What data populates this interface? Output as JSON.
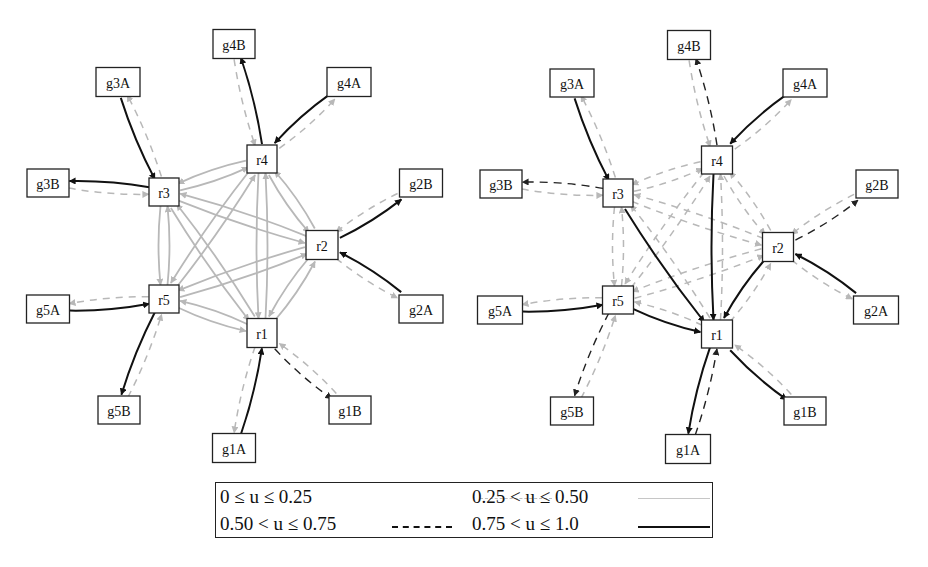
{
  "figure": {
    "title": "",
    "graphs": [
      {
        "id": "left",
        "nodes": [
          {
            "id": "g4B",
            "label": "g4B",
            "x": 234,
            "y": 44,
            "w": 42,
            "h": 29
          },
          {
            "id": "g3A",
            "label": "g3A",
            "x": 118,
            "y": 82,
            "w": 44,
            "h": 29
          },
          {
            "id": "g4A",
            "label": "g4A",
            "x": 349,
            "y": 82,
            "w": 44,
            "h": 29
          },
          {
            "id": "r4",
            "label": "r4",
            "x": 262,
            "y": 159,
            "w": 30,
            "h": 28
          },
          {
            "id": "g3B",
            "label": "g3B",
            "x": 48,
            "y": 183,
            "w": 42,
            "h": 28
          },
          {
            "id": "r3",
            "label": "r3",
            "x": 164,
            "y": 192,
            "w": 30,
            "h": 28
          },
          {
            "id": "g2B",
            "label": "g2B",
            "x": 421,
            "y": 183,
            "w": 43,
            "h": 28
          },
          {
            "id": "r2",
            "label": "r2",
            "x": 322,
            "y": 245,
            "w": 32,
            "h": 29
          },
          {
            "id": "r5",
            "label": "r5",
            "x": 164,
            "y": 299,
            "w": 30,
            "h": 28
          },
          {
            "id": "g5A",
            "label": "g5A",
            "x": 48,
            "y": 309,
            "w": 43,
            "h": 28
          },
          {
            "id": "g2A",
            "label": "g2A",
            "x": 421,
            "y": 309,
            "w": 44,
            "h": 28
          },
          {
            "id": "r1",
            "label": "r1",
            "x": 262,
            "y": 333,
            "w": 30,
            "h": 29
          },
          {
            "id": "g5B",
            "label": "g5B",
            "x": 119,
            "y": 410,
            "w": 42,
            "h": 28
          },
          {
            "id": "g1B",
            "label": "g1B",
            "x": 350,
            "y": 410,
            "w": 42,
            "h": 28
          },
          {
            "id": "g1A",
            "label": "g1A",
            "x": 234,
            "y": 448,
            "w": 43,
            "h": 29
          }
        ],
        "edges": [
          {
            "from": "g3A",
            "to": "r3",
            "u": "0.75-1.0"
          },
          {
            "from": "r3",
            "to": "g3A",
            "u": "0-0.25"
          },
          {
            "from": "r4",
            "to": "g4B",
            "u": "0.75-1.0"
          },
          {
            "from": "g4B",
            "to": "r4",
            "u": "0-0.25"
          },
          {
            "from": "g4A",
            "to": "r4",
            "u": "0.75-1.0"
          },
          {
            "from": "r4",
            "to": "g4A",
            "u": "0-0.25"
          },
          {
            "from": "r3",
            "to": "g3B",
            "u": "0.75-1.0"
          },
          {
            "from": "g3B",
            "to": "r3",
            "u": "0-0.25"
          },
          {
            "from": "r2",
            "to": "g2B",
            "u": "0.75-1.0"
          },
          {
            "from": "g2B",
            "to": "r2",
            "u": "0-0.25"
          },
          {
            "from": "g2A",
            "to": "r2",
            "u": "0.75-1.0"
          },
          {
            "from": "r2",
            "to": "g2A",
            "u": "0-0.25"
          },
          {
            "from": "g5A",
            "to": "r5",
            "u": "0.75-1.0"
          },
          {
            "from": "r5",
            "to": "g5A",
            "u": "0-0.25"
          },
          {
            "from": "r5",
            "to": "g5B",
            "u": "0.75-1.0"
          },
          {
            "from": "g5B",
            "to": "r5",
            "u": "0-0.25"
          },
          {
            "from": "g1A",
            "to": "r1",
            "u": "0.75-1.0"
          },
          {
            "from": "r1",
            "to": "g1A",
            "u": "0-0.25"
          },
          {
            "from": "r1",
            "to": "g1B",
            "u": "0.50-0.75"
          },
          {
            "from": "g1B",
            "to": "r1",
            "u": "0-0.25"
          },
          {
            "from": "r3",
            "to": "r4",
            "u": "0.25-0.50"
          },
          {
            "from": "r4",
            "to": "r3",
            "u": "0.25-0.50"
          },
          {
            "from": "r3",
            "to": "r2",
            "u": "0.25-0.50"
          },
          {
            "from": "r2",
            "to": "r3",
            "u": "0.25-0.50"
          },
          {
            "from": "r3",
            "to": "r5",
            "u": "0.25-0.50"
          },
          {
            "from": "r5",
            "to": "r3",
            "u": "0.25-0.50"
          },
          {
            "from": "r3",
            "to": "r1",
            "u": "0.25-0.50"
          },
          {
            "from": "r1",
            "to": "r3",
            "u": "0.25-0.50"
          },
          {
            "from": "r4",
            "to": "r2",
            "u": "0.25-0.50"
          },
          {
            "from": "r2",
            "to": "r4",
            "u": "0.25-0.50"
          },
          {
            "from": "r4",
            "to": "r5",
            "u": "0.25-0.50"
          },
          {
            "from": "r5",
            "to": "r4",
            "u": "0.25-0.50"
          },
          {
            "from": "r4",
            "to": "r1",
            "u": "0.25-0.50"
          },
          {
            "from": "r1",
            "to": "r4",
            "u": "0.25-0.50"
          },
          {
            "from": "r2",
            "to": "r5",
            "u": "0.25-0.50"
          },
          {
            "from": "r5",
            "to": "r2",
            "u": "0.25-0.50"
          },
          {
            "from": "r2",
            "to": "r1",
            "u": "0.25-0.50"
          },
          {
            "from": "r1",
            "to": "r2",
            "u": "0.25-0.50"
          },
          {
            "from": "r5",
            "to": "r1",
            "u": "0.25-0.50"
          },
          {
            "from": "r1",
            "to": "r5",
            "u": "0.25-0.50"
          }
        ]
      },
      {
        "id": "right",
        "nodes": [
          {
            "id": "g4B",
            "label": "g4B",
            "x": 689,
            "y": 45,
            "w": 43,
            "h": 29
          },
          {
            "id": "g3A",
            "label": "g3A",
            "x": 572,
            "y": 83,
            "w": 44,
            "h": 28
          },
          {
            "id": "g4A",
            "label": "g4A",
            "x": 805,
            "y": 83,
            "w": 44,
            "h": 28
          },
          {
            "id": "r4",
            "label": "r4",
            "x": 717,
            "y": 160,
            "w": 31,
            "h": 28
          },
          {
            "id": "g3B",
            "label": "g3B",
            "x": 501,
            "y": 184,
            "w": 42,
            "h": 28
          },
          {
            "id": "r3",
            "label": "r3",
            "x": 618,
            "y": 193,
            "w": 30,
            "h": 28
          },
          {
            "id": "g2B",
            "label": "g2B",
            "x": 877,
            "y": 184,
            "w": 42,
            "h": 28
          },
          {
            "id": "r2",
            "label": "r2",
            "x": 778,
            "y": 247,
            "w": 31,
            "h": 29
          },
          {
            "id": "r5",
            "label": "r5",
            "x": 618,
            "y": 300,
            "w": 31,
            "h": 28
          },
          {
            "id": "g5A",
            "label": "g5A",
            "x": 500,
            "y": 310,
            "w": 45,
            "h": 28
          },
          {
            "id": "g2A",
            "label": "g2A",
            "x": 876,
            "y": 310,
            "w": 45,
            "h": 28
          },
          {
            "id": "r1",
            "label": "r1",
            "x": 717,
            "y": 334,
            "w": 31,
            "h": 28
          },
          {
            "id": "g5B",
            "label": "g5B",
            "x": 572,
            "y": 411,
            "w": 43,
            "h": 28
          },
          {
            "id": "g1B",
            "label": "g1B",
            "x": 805,
            "y": 411,
            "w": 42,
            "h": 28
          },
          {
            "id": "g1A",
            "label": "g1A",
            "x": 688,
            "y": 449,
            "w": 45,
            "h": 29
          }
        ],
        "edges": [
          {
            "from": "g3A",
            "to": "r3",
            "u": "0.75-1.0"
          },
          {
            "from": "r3",
            "to": "g3A",
            "u": "0-0.25"
          },
          {
            "from": "r4",
            "to": "g4B",
            "u": "0.50-0.75"
          },
          {
            "from": "g4B",
            "to": "r4",
            "u": "0-0.25"
          },
          {
            "from": "g4A",
            "to": "r4",
            "u": "0.75-1.0"
          },
          {
            "from": "r4",
            "to": "g4A",
            "u": "0-0.25"
          },
          {
            "from": "r3",
            "to": "g3B",
            "u": "0.50-0.75"
          },
          {
            "from": "g3B",
            "to": "r3",
            "u": "0-0.25"
          },
          {
            "from": "r2",
            "to": "g2B",
            "u": "0.50-0.75"
          },
          {
            "from": "g2B",
            "to": "r2",
            "u": "0-0.25"
          },
          {
            "from": "g2A",
            "to": "r2",
            "u": "0.75-1.0"
          },
          {
            "from": "r2",
            "to": "g2A",
            "u": "0-0.25"
          },
          {
            "from": "g5A",
            "to": "r5",
            "u": "0.75-1.0"
          },
          {
            "from": "r5",
            "to": "g5A",
            "u": "0-0.25"
          },
          {
            "from": "r5",
            "to": "g5B",
            "u": "0.50-0.75"
          },
          {
            "from": "g5B",
            "to": "r5",
            "u": "0-0.25"
          },
          {
            "from": "r1",
            "to": "g1A",
            "u": "0.75-1.0"
          },
          {
            "from": "g1A",
            "to": "r1",
            "u": "0.50-0.75"
          },
          {
            "from": "r1",
            "to": "g1B",
            "u": "0.75-1.0"
          },
          {
            "from": "g1B",
            "to": "r1",
            "u": "0-0.25"
          },
          {
            "from": "r3",
            "to": "r1",
            "u": "0.75-1.0"
          },
          {
            "from": "r4",
            "to": "r1",
            "u": "0.75-1.0"
          },
          {
            "from": "r2",
            "to": "r1",
            "u": "0.75-1.0"
          },
          {
            "from": "r5",
            "to": "r1",
            "u": "0.75-1.0"
          },
          {
            "from": "r3",
            "to": "r4",
            "u": "0-0.25"
          },
          {
            "from": "r4",
            "to": "r3",
            "u": "0-0.25"
          },
          {
            "from": "r3",
            "to": "r2",
            "u": "0-0.25"
          },
          {
            "from": "r2",
            "to": "r3",
            "u": "0-0.25"
          },
          {
            "from": "r3",
            "to": "r5",
            "u": "0-0.25"
          },
          {
            "from": "r5",
            "to": "r3",
            "u": "0-0.25"
          },
          {
            "from": "r1",
            "to": "r3",
            "u": "0-0.25"
          },
          {
            "from": "r4",
            "to": "r2",
            "u": "0-0.25"
          },
          {
            "from": "r2",
            "to": "r4",
            "u": "0-0.25"
          },
          {
            "from": "r4",
            "to": "r5",
            "u": "0-0.25"
          },
          {
            "from": "r5",
            "to": "r4",
            "u": "0-0.25"
          },
          {
            "from": "r1",
            "to": "r4",
            "u": "0-0.25"
          },
          {
            "from": "r2",
            "to": "r5",
            "u": "0-0.25"
          },
          {
            "from": "r5",
            "to": "r2",
            "u": "0-0.25"
          },
          {
            "from": "r1",
            "to": "r2",
            "u": "0-0.25"
          },
          {
            "from": "r1",
            "to": "r5",
            "u": "0-0.25"
          }
        ]
      }
    ]
  },
  "edge_styles": {
    "0-0.25": {
      "color": "#b8b8b8",
      "width": 1.5,
      "dash": "7,6"
    },
    "0.25-0.50": {
      "color": "#b8b8b8",
      "width": 1.8,
      "dash": ""
    },
    "0.50-0.75": {
      "color": "#222222",
      "width": 1.4,
      "dash": "8,6"
    },
    "0.75-1.0": {
      "color": "#111111",
      "width": 2.0,
      "dash": ""
    }
  },
  "legend": {
    "items": [
      {
        "label": "0 ≤ u ≤ 0.25",
        "style": "0-0.25"
      },
      {
        "label": "0.25 < u ≤ 0.50",
        "style": "0.25-0.50"
      },
      {
        "label": "0.50 < u ≤ 0.75",
        "style": "0.50-0.75"
      },
      {
        "label": "0.75 < u ≤ 1.0",
        "style": "0.75-1.0"
      }
    ]
  }
}
